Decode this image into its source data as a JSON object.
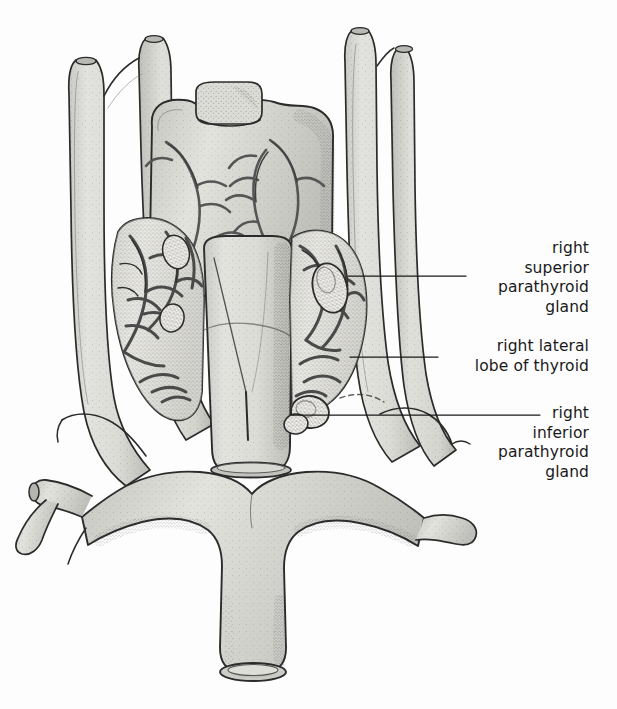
{
  "figure": {
    "style": "stippled pen-and-ink anatomical line drawing",
    "background_color": "#fdfdfd",
    "ink_color": "#2b2b2b",
    "fill_color": "#d8d8d4",
    "vessel_color": "#6e6e6e"
  },
  "labels": [
    {
      "id": "right-superior-parathyroid-gland",
      "lines": [
        "right",
        "superior",
        "parathyroid",
        "gland"
      ],
      "leader": {
        "x1": 348,
        "y1": 276,
        "x2": 466,
        "y2": 276
      }
    },
    {
      "id": "right-lateral-lobe-of-thyroid",
      "lines": [
        "right lateral",
        "lobe of thyroid"
      ],
      "leader": {
        "x1": 350,
        "y1": 357,
        "x2": 438,
        "y2": 357
      }
    },
    {
      "id": "right-inferior-parathyroid-gland",
      "lines": [
        "right",
        "inferior",
        "parathyroid",
        "gland"
      ],
      "leader": {
        "x1": 292,
        "y1": 415,
        "x2": 540,
        "y2": 415
      }
    }
  ],
  "structures": [
    {
      "name": "larynx-thyroid-cartilage",
      "position": "upper-center"
    },
    {
      "name": "epiglottis-notch",
      "position": "top-center"
    },
    {
      "name": "trachea",
      "position": "center-lower"
    },
    {
      "name": "right-lateral-lobe-of-thyroid",
      "position": "center-right"
    },
    {
      "name": "left-lateral-lobe-of-thyroid",
      "position": "center-left"
    },
    {
      "name": "right-superior-parathyroid-gland",
      "position": "mid-right"
    },
    {
      "name": "right-inferior-parathyroid-gland",
      "position": "lower-right-lobe"
    },
    {
      "name": "right-common-carotid-artery",
      "position": "right-vertical"
    },
    {
      "name": "left-common-carotid-artery",
      "position": "left-vertical"
    },
    {
      "name": "left-internal-jugular-vein",
      "position": "far-left-vertical"
    },
    {
      "name": "brachiocephalic-vein-confluence",
      "position": "bottom-center"
    },
    {
      "name": "superior-vena-cava",
      "position": "bottom-center-stump"
    },
    {
      "name": "left-subclavian-artery",
      "position": "lower-left"
    },
    {
      "name": "thyrocervical-trunk",
      "position": "lower-left-branch"
    },
    {
      "name": "superior-thyroid-vessels",
      "position": "upper-lobes"
    },
    {
      "name": "inferior-thyroid-vessels",
      "position": "lower-lobes"
    }
  ]
}
